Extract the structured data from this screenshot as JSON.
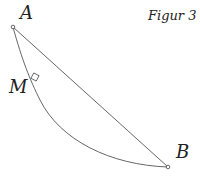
{
  "figure": {
    "title": "Figur 3",
    "points": [
      {
        "label": "A",
        "x": 13,
        "y": 27
      },
      {
        "label": "B",
        "x": 168,
        "y": 167
      },
      {
        "label": "M",
        "x": 36,
        "y": 80
      }
    ],
    "elements": [
      "chord AB (straight line)",
      "curve from A to B through M",
      "right-angle marker at M"
    ],
    "colors": {
      "stroke": "#555555",
      "text": "#222222",
      "background": "#ffffff"
    }
  }
}
